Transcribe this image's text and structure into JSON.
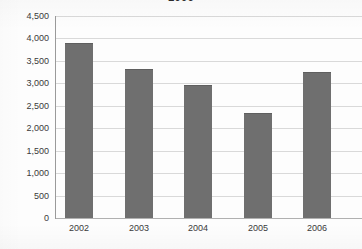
{
  "chart_data": {
    "type": "bar",
    "title": "2006",
    "title_clipped": true,
    "xlabel": "",
    "ylabel": "",
    "categories": [
      "2002",
      "2003",
      "2004",
      "2005",
      "2006"
    ],
    "values": [
      3880,
      3300,
      2940,
      2320,
      3230
    ],
    "series": [
      {
        "name": "Total",
        "values": [
          3880,
          3300,
          2940,
          2320,
          3230
        ]
      }
    ],
    "ylim": [
      0,
      4500
    ],
    "ytick_values": [
      0,
      500,
      1000,
      1500,
      2000,
      2500,
      3000,
      3500,
      4000,
      4500
    ],
    "ytick_labels": [
      "0",
      "500",
      "1,000",
      "1,500",
      "2,000",
      "2,500",
      "3,000",
      "3,500",
      "4,000",
      "4,500"
    ],
    "grid": true,
    "grid_axis": "y",
    "legend": false,
    "legend_position": "none",
    "bar_color": "#6f6f6f",
    "gridline_color": "#d9d9d9",
    "axis_color": "#9a9a9a",
    "background_color": "#fdfdfd",
    "text_color": "#3a3a3a"
  }
}
